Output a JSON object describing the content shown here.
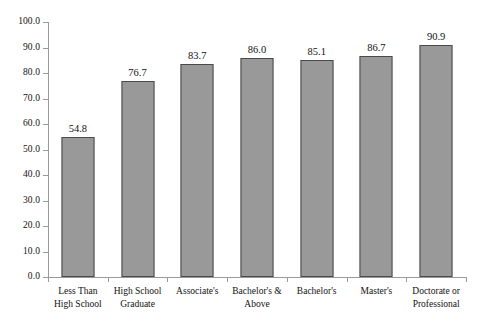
{
  "chart_data": {
    "type": "bar",
    "title": "",
    "subtitle": "",
    "xlabel": "",
    "ylabel": "",
    "ylim": [
      0.0,
      100.0
    ],
    "grid": false,
    "legend": null,
    "y_ticks": [
      "0.0",
      "10.0",
      "20.0",
      "30.0",
      "40.0",
      "50.0",
      "60.0",
      "70.0",
      "80.0",
      "90.0",
      "100.0"
    ],
    "y_tick_values": [
      0.0,
      10.0,
      20.0,
      30.0,
      40.0,
      50.0,
      60.0,
      70.0,
      80.0,
      90.0,
      100.0
    ],
    "categories": [
      "Less Than High School",
      "High School Graduate",
      "Associate's",
      "Bachelor's & Above",
      "Bachelor's",
      "Master's",
      "Doctorate or Professional"
    ],
    "category_lines": [
      [
        "Less Than",
        "High School"
      ],
      [
        "High School",
        "Graduate"
      ],
      [
        "Associate's",
        ""
      ],
      [
        "Bachelor's &",
        "Above"
      ],
      [
        "Bachelor's",
        ""
      ],
      [
        "Master's",
        ""
      ],
      [
        "Doctorate or",
        "Professional"
      ]
    ],
    "values": [
      54.8,
      76.7,
      83.7,
      86.0,
      85.1,
      86.7,
      90.9
    ],
    "value_labels": [
      "54.8",
      "76.7",
      "83.7",
      "86.0",
      "85.1",
      "86.7",
      "90.9"
    ],
    "colors": {
      "bar_fill": "#999999",
      "bar_border": "#4a4a4a",
      "axis": "#9a9a9a",
      "text": "#111111",
      "background": "#ffffff"
    }
  }
}
